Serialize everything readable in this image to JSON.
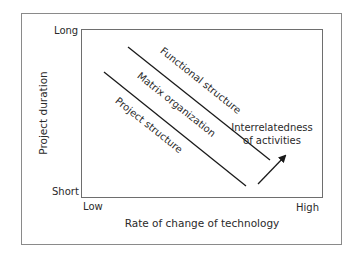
{
  "diagram": {
    "axes": {
      "y_label": "Project duration",
      "x_label": "Rate of change of technology",
      "y_ticks": {
        "top": "Long",
        "bottom": "Short"
      },
      "x_ticks": {
        "left": "Low",
        "right": "High"
      }
    },
    "regions": [
      {
        "label": "Functional structure"
      },
      {
        "label": "Matrix organization"
      },
      {
        "label": "Project structure"
      }
    ],
    "arrow": {
      "label_line1": "Interrelatedness",
      "label_line2": "of activities"
    },
    "colors": {
      "line": "#1a1a1a",
      "frame": "#8a8a8a",
      "box": "#6e6e6e",
      "text": "#2a2a2a"
    }
  }
}
